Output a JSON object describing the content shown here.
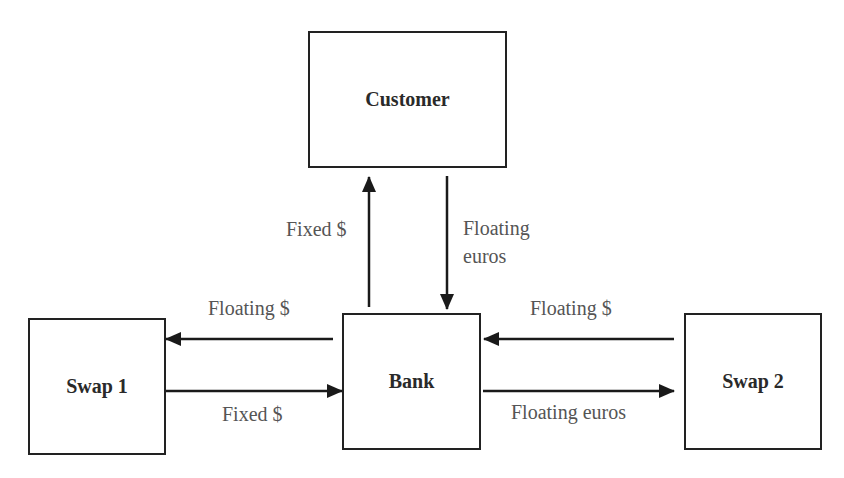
{
  "diagram": {
    "nodes": {
      "customer": {
        "label": "Customer"
      },
      "bank": {
        "label": "Bank"
      },
      "swap1": {
        "label": "Swap 1"
      },
      "swap2": {
        "label": "Swap 2"
      }
    },
    "edges": [
      {
        "from": "Bank",
        "to": "Customer",
        "label": "Fixed $"
      },
      {
        "from": "Customer",
        "to": "Bank",
        "label_line1": "Floating",
        "label_line2": "euros"
      },
      {
        "from": "Bank",
        "to": "Swap 1",
        "label": "Floating $"
      },
      {
        "from": "Swap 1",
        "to": "Bank",
        "label": "Fixed $"
      },
      {
        "from": "Swap 2",
        "to": "Bank",
        "label": "Floating $"
      },
      {
        "from": "Bank",
        "to": "Swap 2",
        "label": "Floating euros"
      }
    ]
  }
}
